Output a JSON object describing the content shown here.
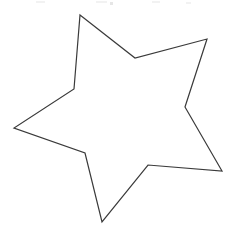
{
  "image": {
    "title": "Hand-drawn five-pointed star outline",
    "description": "A single black outline drawing of an irregular five-pointed star on a plain white background, slightly rotated and asymmetric as if traced by hand.",
    "width": 235,
    "height": 237,
    "background_color": "#ffffff",
    "stroke_color": "#3a3a3a",
    "stroke_width": 1.2,
    "fill_color": "none"
  },
  "shape": {
    "name": "star",
    "type": "polygon",
    "point_count": 5,
    "closed": true,
    "vertices": [
      {
        "role": "outer-point-top",
        "x": 80,
        "y": 15
      },
      {
        "role": "inner-notch-top-right",
        "x": 135,
        "y": 58
      },
      {
        "role": "outer-point-upper-right",
        "x": 207,
        "y": 39
      },
      {
        "role": "inner-notch-right",
        "x": 185,
        "y": 107
      },
      {
        "role": "outer-point-lower-right",
        "x": 222,
        "y": 171
      },
      {
        "role": "inner-notch-bottom-right",
        "x": 148,
        "y": 165
      },
      {
        "role": "outer-point-bottom",
        "x": 102,
        "y": 222
      },
      {
        "role": "inner-notch-bottom-left",
        "x": 85,
        "y": 153
      },
      {
        "role": "outer-point-left",
        "x": 14,
        "y": 128
      },
      {
        "role": "inner-notch-upper-left",
        "x": 74,
        "y": 89
      }
    ],
    "path_d": "M 80 15 L 135 58 L 207 39 L 185 107 L 222 171 L 148 165 L 102 222 L 85 153 L 14 128 L 74 89 Z"
  },
  "artifacts": {
    "label": "faint scanner noise along top edge",
    "color": "#f0f0f0",
    "visible": true
  }
}
